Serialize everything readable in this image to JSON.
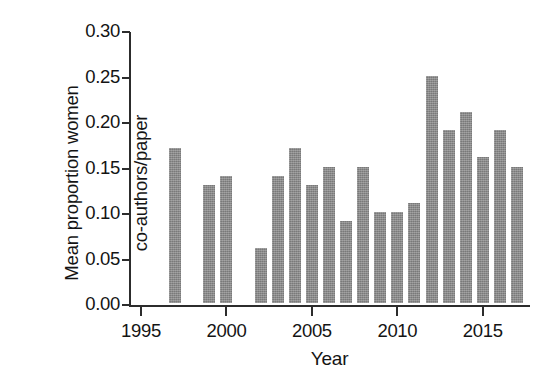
{
  "chart_data": {
    "type": "bar",
    "title": "",
    "xlabel": "Year",
    "ylabel": "Mean proportion women co-authors/paper",
    "ylabel_lines": [
      "Mean proportion women",
      "co-authors/paper"
    ],
    "xlim": [
      1994.3,
      2017.7
    ],
    "ylim": [
      0.0,
      0.3
    ],
    "grid": false,
    "legend": null,
    "bar_color": "#858585",
    "axis_color": "#2c2c2c",
    "background_color": "#ffffff",
    "ytick_labels": [
      "0.00",
      "0.05",
      "0.10",
      "0.15",
      "0.20",
      "0.25",
      "0.30"
    ],
    "ytick_values": [
      0.0,
      0.05,
      0.1,
      0.15,
      0.2,
      0.25,
      0.3
    ],
    "xtick_labels": [
      "1995",
      "2000",
      "2005",
      "2010",
      "2015"
    ],
    "xtick_values": [
      1995,
      2000,
      2005,
      2010,
      2015
    ],
    "categories": [
      1997,
      1999,
      2000,
      2002,
      2003,
      2004,
      2005,
      2006,
      2007,
      2008,
      2009,
      2010,
      2011,
      2012,
      2013,
      2014,
      2015,
      2016,
      2017
    ],
    "values": [
      0.17,
      0.13,
      0.14,
      0.06,
      0.14,
      0.17,
      0.13,
      0.15,
      0.09,
      0.15,
      0.1,
      0.1,
      0.11,
      0.25,
      0.19,
      0.21,
      0.16,
      0.19,
      0.15
    ],
    "missing_years": [
      1995,
      1996,
      1998,
      2001
    ]
  }
}
